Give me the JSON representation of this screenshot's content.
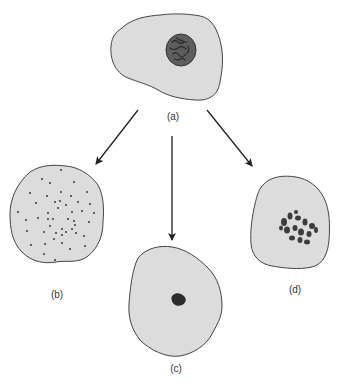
{
  "figure": {
    "type": "cell-fate diagram",
    "colors": {
      "cytoplasm": "#dcdcdc",
      "membrane": "#444444",
      "nucleus": "#5a5a5a",
      "chromatin": "#2e2e2e",
      "arrow": "#222222"
    },
    "cells": [
      {
        "id": "a",
        "label": "(a)",
        "description": "cell with intact nucleus",
        "label_x": 173,
        "label_y": 111
      },
      {
        "id": "b",
        "label": "(b)",
        "description": "cell with dispersed dots",
        "label_x": 57,
        "label_y": 289
      },
      {
        "id": "c",
        "label": "(c)",
        "description": "cell with single condensed dark spot",
        "label_x": 176,
        "label_y": 363
      },
      {
        "id": "d",
        "label": "(d)",
        "description": "cell with clustered chromosome fragments",
        "label_x": 295,
        "label_y": 284
      }
    ],
    "arrows": [
      {
        "from": "a",
        "to": "b"
      },
      {
        "from": "a",
        "to": "c"
      },
      {
        "from": "a",
        "to": "d"
      }
    ]
  }
}
